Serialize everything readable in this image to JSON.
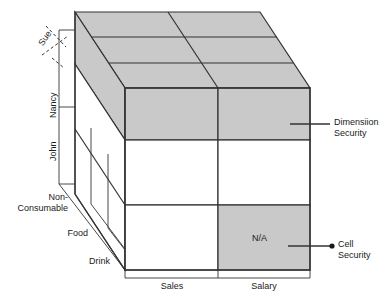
{
  "diagram": {
    "type": "3d-cube-grid",
    "colors": {
      "shaded_cell": "#c9c9c9",
      "unshaded_cell": "#ffffff",
      "stroke": "#333333",
      "text": "#1a1a1a"
    },
    "axes": {
      "rows": {
        "name": "employee-axis",
        "labels": [
          "Sue",
          "Nancy",
          "John"
        ]
      },
      "depth": {
        "name": "product-axis",
        "labels": [
          "Non-\nConsumable",
          "Food",
          "Drink"
        ],
        "label_non_consumable_line1": "Non-",
        "label_non_consumable_line2": "Consumable",
        "label_food": "Food",
        "label_drink": "Drink"
      },
      "columns": {
        "name": "measure-axis",
        "labels": [
          "Sales",
          "Salary"
        ]
      }
    },
    "cells": {
      "na_label": "N/A"
    },
    "callouts": [
      {
        "id": "dimension-security",
        "line1": "Dimensiion",
        "line2": "Security"
      },
      {
        "id": "cell-security",
        "line1": "Cell",
        "line2": "Security"
      }
    ]
  }
}
